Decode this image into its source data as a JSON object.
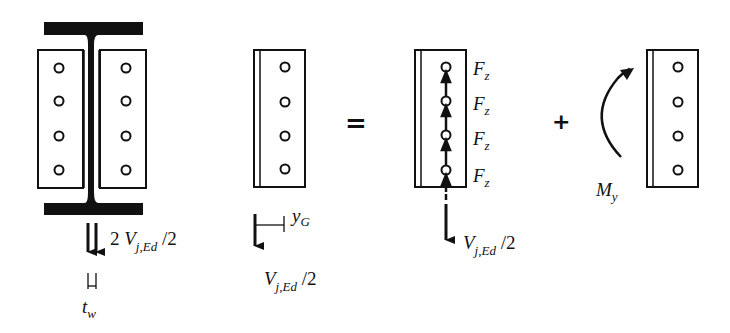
{
  "diagram": {
    "colors": {
      "stroke": "#111111",
      "background": "#ffffff"
    },
    "panel1": {
      "name": "I-beam with web cover plates",
      "bolts_per_plate": 4,
      "force_label": {
        "prefix": "2 ",
        "symbol": "V",
        "subscript": "j,Ed",
        "suffix": " /2"
      },
      "thickness_label": {
        "symbol": "t",
        "subscript": "w"
      }
    },
    "panel2": {
      "name": "single cover plate with eccentric shear",
      "bolts": 4,
      "eccentricity_label": {
        "symbol": "y",
        "subscript": "G"
      },
      "force_label": {
        "symbol": "V",
        "subscript": "j,Ed",
        "suffix": " /2"
      }
    },
    "equals_sign": "=",
    "panel3": {
      "name": "plate with bolt shear forces",
      "bolt_forces": [
        {
          "symbol": "F",
          "subscript": "z"
        },
        {
          "symbol": "F",
          "subscript": "z"
        },
        {
          "symbol": "F",
          "subscript": "z"
        },
        {
          "symbol": "F",
          "subscript": "z"
        }
      ],
      "force_label": {
        "symbol": "V",
        "subscript": "j,Ed",
        "suffix": " /2"
      }
    },
    "plus_sign": "+",
    "panel4": {
      "name": "plate with moment",
      "bolts": 4,
      "moment_label": {
        "symbol": "M",
        "subscript": "y"
      }
    }
  }
}
